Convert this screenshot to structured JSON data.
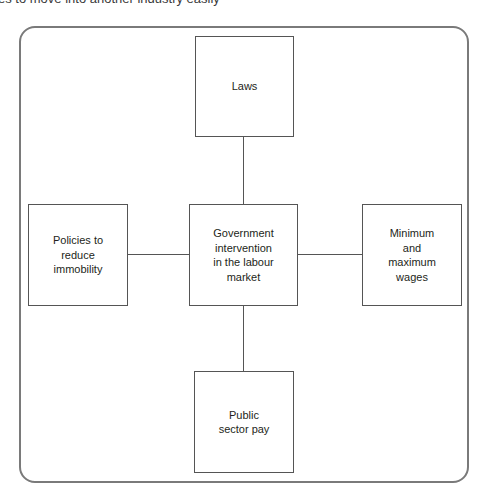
{
  "header_text": "es to move into another industry easily",
  "diagram": {
    "center": {
      "label": "Government\nintervention\nin the labour\nmarket"
    },
    "nodes": {
      "top": {
        "label": "Laws"
      },
      "left": {
        "label": "Policies to\nreduce\nimmobility"
      },
      "right": {
        "label": "Minimum\nand\nmaximum\nwages"
      },
      "bottom": {
        "label": "Public\nsector pay"
      }
    }
  },
  "colors": {
    "frame": "#7a7a7a",
    "box_border": "#555555",
    "text": "#231f20"
  }
}
